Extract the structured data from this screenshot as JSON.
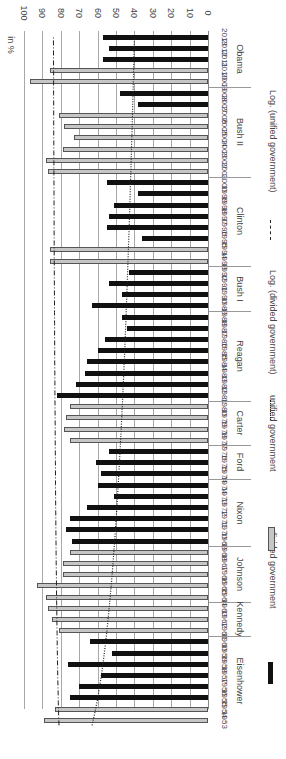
{
  "chart_data": {
    "type": "bar",
    "orientation": "rotated 90deg; years along vertical axis (2013 top, 1953 bottom), value axis horizontal (0 at right, 100 at left)",
    "ylabel": "in %",
    "ylim": [
      0,
      100
    ],
    "yticks": [
      "0",
      "10",
      "20",
      "30",
      "40",
      "50",
      "60",
      "70",
      "80",
      "90",
      "100"
    ],
    "grid": true,
    "legend_position": "right side (rotated)",
    "legend": [
      {
        "label": "divided government",
        "style": "black filled bar"
      },
      {
        "label": "unified government",
        "style": "grey outlined bar"
      },
      {
        "label": "Log. (divided government)",
        "style": "dotted line"
      },
      {
        "label": "Log. (unified government)",
        "style": "dash-dot line"
      }
    ],
    "series": [
      {
        "year": "2013",
        "president": "Obama",
        "gov": "divided",
        "value": 57
      },
      {
        "year": "2012",
        "president": "Obama",
        "gov": "divided",
        "value": 54
      },
      {
        "year": "2011",
        "president": "Obama",
        "gov": "divided",
        "value": 57
      },
      {
        "year": "2010",
        "president": "Obama",
        "gov": "unified",
        "value": 86
      },
      {
        "year": "2009",
        "president": "Obama",
        "gov": "unified",
        "value": 97
      },
      {
        "year": "2008",
        "president": "Bush II",
        "gov": "divided",
        "value": 48
      },
      {
        "year": "2007",
        "president": "Bush II",
        "gov": "divided",
        "value": 38
      },
      {
        "year": "2006",
        "president": "Bush II",
        "gov": "unified",
        "value": 81
      },
      {
        "year": "2005",
        "president": "Bush II",
        "gov": "unified",
        "value": 78
      },
      {
        "year": "2004",
        "president": "Bush II",
        "gov": "unified",
        "value": 73
      },
      {
        "year": "2003",
        "president": "Bush II",
        "gov": "unified",
        "value": 79
      },
      {
        "year": "2002",
        "president": "Bush II",
        "gov": "unified",
        "value": 88
      },
      {
        "year": "2001",
        "president": "Bush II",
        "gov": "unified",
        "value": 87
      },
      {
        "year": "2000",
        "president": "Clinton",
        "gov": "divided",
        "value": 55
      },
      {
        "year": "1999",
        "president": "Clinton",
        "gov": "divided",
        "value": 38
      },
      {
        "year": "1998",
        "president": "Clinton",
        "gov": "divided",
        "value": 51
      },
      {
        "year": "1997",
        "president": "Clinton",
        "gov": "divided",
        "value": 54
      },
      {
        "year": "1996",
        "president": "Clinton",
        "gov": "divided",
        "value": 55
      },
      {
        "year": "1995",
        "president": "Clinton",
        "gov": "divided",
        "value": 36
      },
      {
        "year": "1994",
        "president": "Clinton",
        "gov": "unified",
        "value": 86
      },
      {
        "year": "1993",
        "president": "Clinton",
        "gov": "unified",
        "value": 86
      },
      {
        "year": "1992",
        "president": "Bush I",
        "gov": "divided",
        "value": 43
      },
      {
        "year": "1991",
        "president": "Bush I",
        "gov": "divided",
        "value": 54
      },
      {
        "year": "1990",
        "president": "Bush I",
        "gov": "divided",
        "value": 47
      },
      {
        "year": "1989",
        "president": "Bush I",
        "gov": "divided",
        "value": 63
      },
      {
        "year": "1988",
        "president": "Reagan",
        "gov": "divided",
        "value": 47
      },
      {
        "year": "1987",
        "president": "Reagan",
        "gov": "divided",
        "value": 44
      },
      {
        "year": "1986",
        "president": "Reagan",
        "gov": "divided",
        "value": 56
      },
      {
        "year": "1985",
        "president": "Reagan",
        "gov": "divided",
        "value": 60
      },
      {
        "year": "1984",
        "president": "Reagan",
        "gov": "divided",
        "value": 66
      },
      {
        "year": "1983",
        "president": "Reagan",
        "gov": "divided",
        "value": 67
      },
      {
        "year": "1982",
        "president": "Reagan",
        "gov": "divided",
        "value": 72
      },
      {
        "year": "1981",
        "president": "Reagan",
        "gov": "divided",
        "value": 82
      },
      {
        "year": "1980",
        "president": "Carter",
        "gov": "unified",
        "value": 75
      },
      {
        "year": "1979",
        "president": "Carter",
        "gov": "unified",
        "value": 77
      },
      {
        "year": "1978",
        "president": "Carter",
        "gov": "unified",
        "value": 78
      },
      {
        "year": "1977",
        "president": "Carter",
        "gov": "unified",
        "value": 75
      },
      {
        "year": "1976",
        "president": "Ford",
        "gov": "divided",
        "value": 54
      },
      {
        "year": "1975",
        "president": "Ford",
        "gov": "divided",
        "value": 61
      },
      {
        "year": "1974",
        "president": "Ford",
        "gov": "divided",
        "value": 58
      },
      {
        "year": "1974",
        "president": "Nixon",
        "gov": "divided",
        "value": 60
      },
      {
        "year": "1973",
        "president": "Nixon",
        "gov": "divided",
        "value": 51
      },
      {
        "year": "1972",
        "president": "Nixon",
        "gov": "divided",
        "value": 66
      },
      {
        "year": "1971",
        "president": "Nixon",
        "gov": "divided",
        "value": 75
      },
      {
        "year": "1970",
        "president": "Nixon",
        "gov": "divided",
        "value": 77
      },
      {
        "year": "1969",
        "president": "Nixon",
        "gov": "divided",
        "value": 74
      },
      {
        "year": "1968",
        "president": "Johnson",
        "gov": "unified",
        "value": 75
      },
      {
        "year": "1967",
        "president": "Johnson",
        "gov": "unified",
        "value": 79
      },
      {
        "year": "1966",
        "president": "Johnson",
        "gov": "unified",
        "value": 79
      },
      {
        "year": "1965",
        "president": "Johnson",
        "gov": "unified",
        "value": 93
      },
      {
        "year": "1964",
        "president": "Johnson",
        "gov": "unified",
        "value": 88
      },
      {
        "year": "1963",
        "president": "Kennedy",
        "gov": "unified",
        "value": 87
      },
      {
        "year": "1962",
        "president": "Kennedy",
        "gov": "unified",
        "value": 85
      },
      {
        "year": "1961",
        "president": "Kennedy",
        "gov": "unified",
        "value": 81
      },
      {
        "year": "1960",
        "president": "Eisenhower",
        "gov": "divided",
        "value": 64
      },
      {
        "year": "1959",
        "president": "Eisenhower",
        "gov": "divided",
        "value": 52
      },
      {
        "year": "1958",
        "president": "Eisenhower",
        "gov": "divided",
        "value": 76
      },
      {
        "year": "1957",
        "president": "Eisenhower",
        "gov": "divided",
        "value": 58
      },
      {
        "year": "1956",
        "president": "Eisenhower",
        "gov": "divided",
        "value": 70
      },
      {
        "year": "1955",
        "president": "Eisenhower",
        "gov": "divided",
        "value": 75
      },
      {
        "year": "1954",
        "president": "Eisenhower",
        "gov": "unified",
        "value": 83
      },
      {
        "year": "1953",
        "president": "Eisenhower",
        "gov": "unified",
        "value": 89
      }
    ],
    "trendlines": [
      {
        "name": "Log. (divided government)",
        "style": "dotted",
        "start_1953": 63,
        "end_2013": 40
      },
      {
        "name": "Log. (unified government)",
        "style": "dash-dot",
        "start_1953": 81,
        "end_2013": 84
      }
    ],
    "presidents": [
      "Obama",
      "Bush II",
      "Clinton",
      "Bush I",
      "Reagan",
      "Carter",
      "Ford",
      "Nixon",
      "Johnson",
      "Kennedy",
      "Eisenhower"
    ]
  },
  "colors": {
    "divided": "#111111",
    "unified": "#c6c6c6",
    "grid": "#a8a8a8"
  }
}
